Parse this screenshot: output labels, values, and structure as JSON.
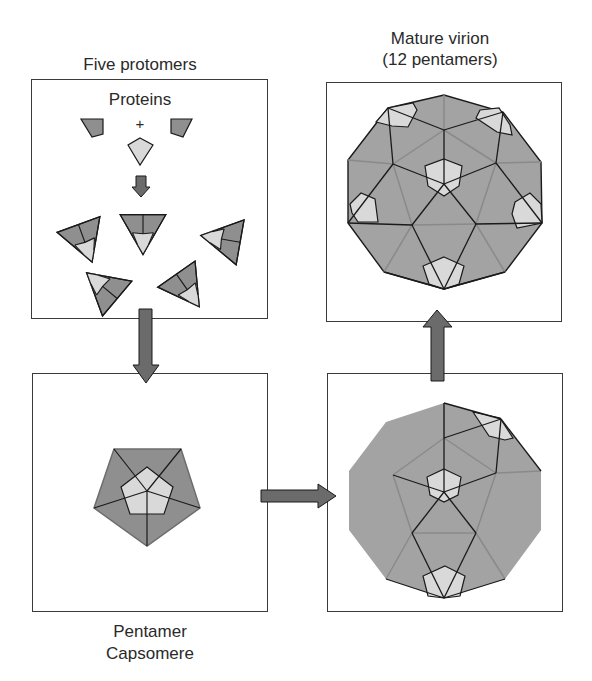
{
  "diagram": {
    "title_top_left": "Five protomers",
    "title_top_right_line1": "Mature virion",
    "title_top_right_line2": "(12 pentamers)",
    "inner_label_proteins": "Proteins",
    "plus_sign": "+",
    "caption_bottom_left_line1": "Pentamer",
    "caption_bottom_left_line2": "Capsomere",
    "panels": [
      {
        "id": "protomers",
        "description": "Three protein subunits combine into five triangular protomers"
      },
      {
        "id": "pentamer",
        "description": "Five protomers assemble into a pentamer capsomere"
      },
      {
        "id": "partial-capsid",
        "description": "Pentamers assemble into a partial icosahedral shell"
      },
      {
        "id": "mature-virion",
        "description": "Complete icosahedral virion of 12 pentamers"
      }
    ],
    "flow": [
      "protomers",
      "pentamer",
      "partial-capsid",
      "mature-virion"
    ]
  },
  "colors": {
    "dark_fill": "#8f8f8f",
    "light_fill": "#d9d9d9",
    "shell_fill": "#a3a3a3",
    "arrow_fill": "#6b6b6b",
    "line": "#1a1a1a",
    "box_border": "#3a3a3a"
  }
}
